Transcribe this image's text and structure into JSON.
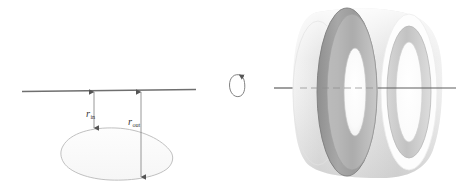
{
  "figure": {
    "canvas": {
      "width": 456,
      "height": 187,
      "background": "#ffffff"
    },
    "colors": {
      "axis_line": "#6f6f6f",
      "label_text": "#3b3b3b",
      "measure_arrow": "#555555",
      "region_outline": "#b9b9b9",
      "region_fill": "#fbfbfb",
      "torus_outer_light": "#eeeeee",
      "torus_outer_mid": "#dedede",
      "torus_band_dark": "#9a9a9a",
      "torus_band_mid": "#bdbdbd",
      "torus_hole_white": "#ffffff",
      "rotation_arrow": "#555555"
    },
    "left_panel": {
      "name": "cross-section-diagram",
      "axis": {
        "name": "axis-of-revolution",
        "x1": 22,
        "y1": 91,
        "x2": 196,
        "y2": 90
      },
      "region": {
        "name": "planar-region",
        "description": "lens / leaf shaped closed region below the axis",
        "bounds": {
          "x": 62,
          "y": 128,
          "width": 110,
          "height": 52
        }
      },
      "measures": [
        {
          "name": "r-in",
          "label_main": "r",
          "label_sub": "in",
          "label_x": 88,
          "label_y": 116,
          "arrow_x": 94,
          "arrow_top": 92,
          "arrow_bottom": 128,
          "double_headed": true
        },
        {
          "name": "r-out",
          "label_main": "r",
          "label_sub": "out",
          "label_x": 131,
          "label_y": 124,
          "arrow_x": 141,
          "arrow_top": 92,
          "arrow_bottom": 177,
          "double_headed": true
        }
      ]
    },
    "rotation_indicator": {
      "name": "rotation-arrow",
      "center_x": 237,
      "center_y": 84,
      "rx": 7.5,
      "ry": 11.5
    },
    "right_panel": {
      "name": "solid-of-revolution",
      "description": "three dimensional washer / torus-like solid shown in gray shading",
      "bounds": {
        "x": 293,
        "y": 8,
        "width": 150,
        "height": 170
      },
      "axis": {
        "name": "axis-of-revolution-3d",
        "x1": 274,
        "y1": 88,
        "x2": 456,
        "y2": 88
      },
      "features": [
        {
          "name": "outer-surface",
          "kind": "shell"
        },
        {
          "name": "cut-band-dark",
          "kind": "annulus"
        },
        {
          "name": "inner-hole-left",
          "kind": "hole"
        },
        {
          "name": "inner-hole-right",
          "kind": "hole"
        }
      ]
    }
  }
}
